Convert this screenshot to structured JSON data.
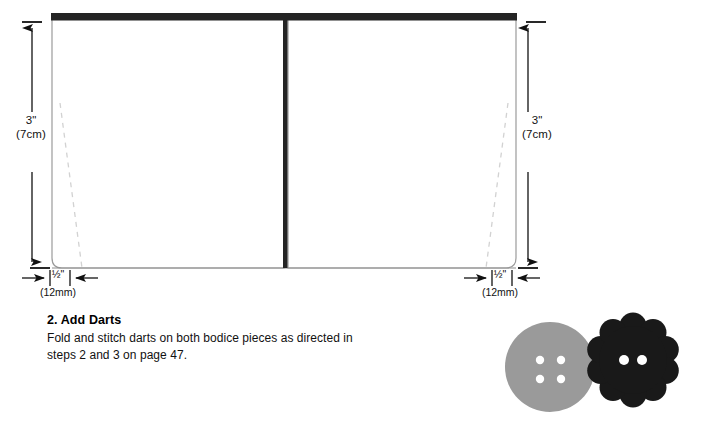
{
  "page": {
    "background": "#ffffff"
  },
  "diagram": {
    "name": "bodice-pattern-pieces",
    "colors": {
      "fabric_fill": "#ffffff",
      "outline": "#8a8a8a",
      "top_edge": "#1f1f1f",
      "center_seam": "#1f1f1f",
      "dart_dash": "#cfcfcf",
      "dimension_line": "#111111"
    },
    "dimensions": {
      "left_vertical": {
        "value": "3\"",
        "metric": "(7cm)",
        "arrows": "both-ends"
      },
      "right_vertical": {
        "value": "3\"",
        "metric": "(7cm)",
        "arrows": "both-ends"
      },
      "left_horizontal": {
        "value": "½\"",
        "metric": "(12mm)",
        "arrows": "inward"
      },
      "right_horizontal": {
        "value": "½\"",
        "metric": "(12mm)",
        "arrows": "inward"
      }
    }
  },
  "instructions": {
    "step_heading": "2. Add Darts",
    "body": "Fold and stitch darts on both bodice pieces as directed in steps 2 and 3 on page 47."
  },
  "buttons_illustration": {
    "name": "decorative-buttons",
    "items": [
      {
        "shape": "round",
        "color": "#9a9a9a",
        "holes": 4,
        "hole_color": "#ffffff"
      },
      {
        "shape": "scalloped-flower",
        "color": "#191919",
        "holes": 2,
        "hole_color": "#ffffff"
      }
    ]
  }
}
